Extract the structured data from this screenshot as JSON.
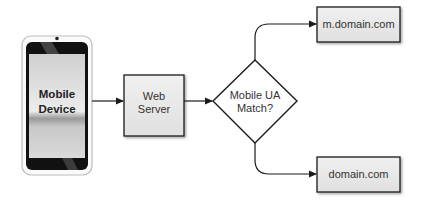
{
  "diagram": {
    "type": "flowchart",
    "nodes": {
      "mobile_device": {
        "label_line1": "Mobile",
        "label_line2": "Device",
        "shape": "phone"
      },
      "web_server": {
        "label_line1": "Web",
        "label_line2": "Server",
        "shape": "box"
      },
      "decision": {
        "label_line1": "Mobile UA",
        "label_line2": "Match?",
        "shape": "diamond"
      },
      "mobile_site": {
        "label": "m.domain.com",
        "shape": "box"
      },
      "desktop_site": {
        "label": "domain.com",
        "shape": "box"
      }
    },
    "edges": [
      {
        "from": "mobile_device",
        "to": "web_server"
      },
      {
        "from": "web_server",
        "to": "decision"
      },
      {
        "from": "decision",
        "to": "mobile_site"
      },
      {
        "from": "decision",
        "to": "desktop_site"
      }
    ],
    "colors": {
      "box_fill": "#e8e8e8",
      "stroke": "#1a1a1a",
      "phone_body": "#111111",
      "phone_screen": "#d8d8d8"
    }
  }
}
